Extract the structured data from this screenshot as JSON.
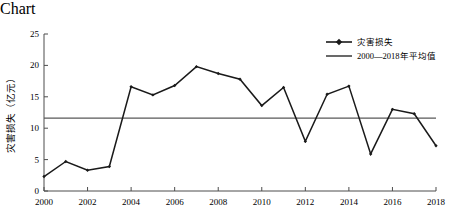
{
  "chart_data": {
    "type": "line",
    "title": "",
    "xlabel": "年份",
    "ylabel": "灾害损失（亿元）",
    "x": [
      2000,
      2001,
      2002,
      2003,
      2004,
      2005,
      2006,
      2007,
      2008,
      2009,
      2010,
      2011,
      2012,
      2013,
      2014,
      2015,
      2016,
      2017,
      2018
    ],
    "series": [
      {
        "name": "灾害损失",
        "values": [
          2.3,
          4.7,
          3.3,
          3.9,
          16.6,
          15.3,
          16.8,
          19.8,
          18.7,
          17.8,
          13.6,
          16.5,
          7.9,
          15.4,
          16.7,
          5.9,
          13.0,
          12.3,
          7.2
        ],
        "marker": "diamond",
        "color": "#1a1a1a"
      },
      {
        "name": "2000—2018年平均值",
        "type": "horizontal-line",
        "value": 11.6,
        "color": "#595959"
      }
    ],
    "xlim": [
      2000,
      2018
    ],
    "ylim": [
      0,
      25
    ],
    "ytick_values": [
      0,
      5,
      10,
      15,
      20,
      25
    ],
    "ytick_labels": [
      "0",
      "5",
      "10",
      "15",
      "20",
      "25"
    ],
    "xtick_values": [
      2000,
      2002,
      2004,
      2006,
      2008,
      2010,
      2012,
      2014,
      2016,
      2018
    ],
    "xtick_labels": [
      "2000",
      "2002",
      "2004",
      "2006",
      "2008",
      "2010",
      "2012",
      "2014",
      "2016",
      "2018"
    ],
    "grid": false,
    "legend_position": "top-right",
    "legend": [
      "灾害损失",
      "2000—2018年平均值"
    ]
  }
}
